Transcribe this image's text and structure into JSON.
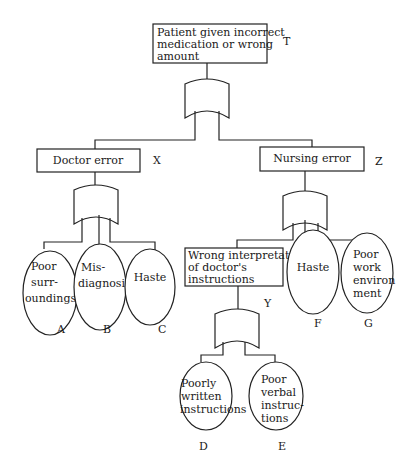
{
  "diagram": {
    "type": "fault-tree",
    "top_event": {
      "id": "T",
      "label_lines": [
        "Patient given incorrect",
        "medication or wrong",
        "amount"
      ],
      "gate": "OR"
    },
    "intermediate_events": [
      {
        "id": "X",
        "label_lines": [
          "Doctor error"
        ],
        "gate": "OR",
        "parent": "T"
      },
      {
        "id": "Z",
        "label_lines": [
          "Nursing error"
        ],
        "gate": "OR",
        "parent": "T"
      },
      {
        "id": "Y",
        "label_lines": [
          "Wrong interpretation",
          "of doctor's",
          "instructions"
        ],
        "gate": "OR",
        "parent": "Z"
      }
    ],
    "basic_events": [
      {
        "id": "A",
        "label_lines": [
          "Poor",
          "surr-",
          "oundings"
        ],
        "parent": "X"
      },
      {
        "id": "B",
        "label_lines": [
          "Mis-",
          "diagnosis"
        ],
        "parent": "X"
      },
      {
        "id": "C",
        "label_lines": [
          "Haste"
        ],
        "parent": "X"
      },
      {
        "id": "F",
        "label_lines": [
          "Haste"
        ],
        "parent": "Z"
      },
      {
        "id": "G",
        "label_lines": [
          "Poor",
          "work",
          "environ",
          "ment"
        ],
        "parent": "Z"
      },
      {
        "id": "D",
        "label_lines": [
          "Poorly",
          "written",
          "instructions"
        ],
        "parent": "Y"
      },
      {
        "id": "E",
        "label_lines": [
          "Poor",
          "verbal",
          "instruc-",
          "tions"
        ],
        "parent": "Y"
      }
    ]
  }
}
